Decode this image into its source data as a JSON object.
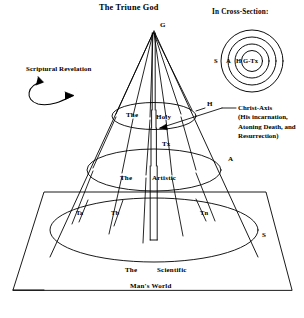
{
  "diagram": {
    "title": "The Triune God",
    "bottom_caption": "Man's World",
    "apex_label": "G",
    "axis_label": "Tx",
    "levels": [
      {
        "id": "holy",
        "label_left": "The",
        "label_right": "Holy",
        "side_marker": "H"
      },
      {
        "id": "artistic",
        "label_left": "The",
        "label_right": "Artistic",
        "side_marker": "A"
      },
      {
        "id": "scientific",
        "label_left": "The",
        "label_right": "Scientific",
        "side_marker": "S"
      }
    ],
    "base_markers": [
      "Ta",
      "Tb",
      "Tn"
    ],
    "left_annotation": {
      "label": "Scriptural Revelation",
      "arrow": "curved-double-arrow"
    },
    "right_annotation": {
      "heading": "Christ-Axis",
      "lines": [
        "(His incarnation,",
        "Atoning Death, and",
        "Resurrection)"
      ]
    },
    "cross_section": {
      "heading": "In Cross-Section:",
      "outer_label": "S",
      "mid_label": "A",
      "inner_label": "H",
      "core_label": "G-Tx"
    },
    "colors": {
      "ink": "#000000",
      "paper": "#ffffff"
    }
  }
}
